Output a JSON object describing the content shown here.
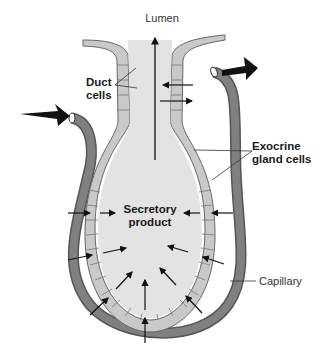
{
  "diagram": {
    "labels": {
      "lumen": "Lumen",
      "duct_cells_line1": "Duct",
      "duct_cells_line2": "cells",
      "exocrine_line1": "Exocrine",
      "exocrine_line2": "gland cells",
      "secretory_line1": "Secretory",
      "secretory_line2": "product",
      "capillary": "Capillary"
    },
    "colors": {
      "lumen_fill": "#e3e3e3",
      "cell_fill": "#c8c8c8",
      "cell_stroke": "#666666",
      "capillary_fill": "#7a7a7a",
      "arrow": "#111111",
      "background": "#ffffff"
    },
    "flows": [
      {
        "name": "blood-in",
        "direction": "into capillary (left)"
      },
      {
        "name": "blood-out",
        "direction": "out of capillary (right)"
      },
      {
        "name": "secretion-out",
        "direction": "up through duct to lumen"
      }
    ]
  }
}
